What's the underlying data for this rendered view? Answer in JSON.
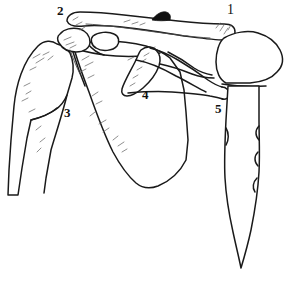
{
  "figure": {
    "view": "anterior",
    "background_color": "#ffffff",
    "ink_color": "#1a1a1a",
    "shading_color": "#6a6a6a",
    "width": 292,
    "height": 285
  },
  "labels": [
    {
      "id": "label-1",
      "text": "1",
      "x": 227,
      "y": 4,
      "refers_to": "clavicle-sternal-end",
      "style": "thin-one"
    },
    {
      "id": "label-2",
      "text": "2",
      "x": 57,
      "y": 4,
      "refers_to": "clavicle-acromial-end",
      "style": "normal"
    },
    {
      "id": "label-3",
      "text": "3",
      "x": 64,
      "y": 106,
      "refers_to": "humerus",
      "style": "normal"
    },
    {
      "id": "label-4",
      "text": "4",
      "x": 142,
      "y": 88,
      "refers_to": "scapula-body",
      "style": "normal"
    },
    {
      "id": "label-5",
      "text": "5",
      "x": 215,
      "y": 102,
      "refers_to": "sternum-first-rib",
      "style": "normal"
    }
  ],
  "structures": [
    {
      "id": "clavicle",
      "name": "clavicle",
      "label_number": "2"
    },
    {
      "id": "humerus",
      "name": "humerus",
      "label_number": "3"
    },
    {
      "id": "scapula",
      "name": "scapula",
      "label_number": "4"
    },
    {
      "id": "sternum",
      "name": "sternum",
      "label_number": "5"
    },
    {
      "id": "first-rib",
      "name": "first rib",
      "label_number": "5"
    },
    {
      "id": "coracoid",
      "name": "coracoid process",
      "label_number": ""
    },
    {
      "id": "acromion",
      "name": "acromion",
      "label_number": ""
    }
  ]
}
